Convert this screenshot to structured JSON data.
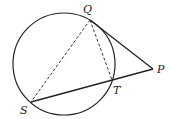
{
  "diagram": {
    "type": "circle-tangent-secant",
    "circle": {
      "cx": 64,
      "cy": 64,
      "r": 51
    },
    "points": {
      "Q": {
        "label": "Q",
        "x": 90,
        "y": 20,
        "lx": 83,
        "ly": 13
      },
      "P": {
        "label": "P",
        "x": 153,
        "y": 69,
        "lx": 157,
        "ly": 73
      },
      "T": {
        "label": "T",
        "x": 112,
        "y": 80,
        "lx": 113,
        "ly": 94
      },
      "S": {
        "label": "S",
        "x": 31,
        "y": 102,
        "lx": 20,
        "ly": 114
      }
    },
    "segments": [
      {
        "from": "Q",
        "to": "P",
        "style": "solid"
      },
      {
        "from": "S",
        "to": "P",
        "style": "solid"
      },
      {
        "from": "Q",
        "to": "S",
        "style": "dashed"
      },
      {
        "from": "Q",
        "to": "T",
        "style": "dashed"
      }
    ],
    "colors": {
      "stroke": "#222222",
      "background": "#ffffff"
    }
  }
}
